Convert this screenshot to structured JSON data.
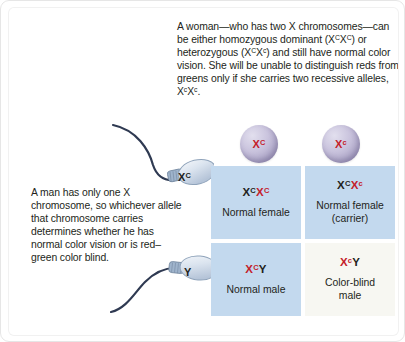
{
  "captions": {
    "female": "A woman—who has two X chromosomes—can be either homozygous dominant (X X ) or heterozygous (X X ) and still have normal color vision. She will be unable to distinguish reds from greens only if she carries two recessive alleles, X X .",
    "female_plain": "A woman—who has two X chromosomes—can be either homozygous dominant (XCXC) or heterozygous (XCXc) and still have normal color vision. She will be unable to distinguish reds from greens only if she carries two recessive alleles, XcXc.",
    "male": "A man has only one X chromosome, so whichever allele that chromosome carries determines whether he has normal color vision or is red–green color blind."
  },
  "gametes": {
    "eggs": [
      {
        "name": "egg-dominant",
        "allele_base": "X",
        "allele_sup": "C",
        "full": "XC"
      },
      {
        "name": "egg-recessive",
        "allele_base": "X",
        "allele_sup": "c",
        "full": "Xc"
      }
    ],
    "sperm": [
      {
        "name": "sperm-x",
        "allele_base": "X",
        "allele_sup": "C",
        "full": "XC"
      },
      {
        "name": "sperm-y",
        "allele_base": "Y",
        "allele_sup": "",
        "full": "Y"
      }
    ]
  },
  "punnett": {
    "cells": [
      {
        "position": "top-left",
        "first_base": "X",
        "first_sup": "C",
        "second_base": "X",
        "second_sup": "C",
        "genotype": "XCXC",
        "phenotype": "Normal female",
        "background": "#c3d9ee"
      },
      {
        "position": "top-right",
        "first_base": "X",
        "first_sup": "C",
        "second_base": "X",
        "second_sup": "c",
        "genotype": "XCXc",
        "phenotype": "Normal female\n(carrier)",
        "background": "#c3d9ee"
      },
      {
        "position": "bottom-left",
        "first_base": "X",
        "first_sup": "C",
        "second_base": "Y",
        "second_sup": "",
        "genotype": "XCY",
        "phenotype": "Normal male",
        "background": "#c3d9ee"
      },
      {
        "position": "bottom-right",
        "first_base": "X",
        "first_sup": "c",
        "second_base": "Y",
        "second_sup": "",
        "genotype": "XcY",
        "phenotype": "Color-blind\nmale",
        "background": "#f7f7f2"
      }
    ]
  },
  "colors": {
    "allele_red": "#c4202a",
    "allele_dark": "#231f20",
    "cell_blue": "#c3d9ee",
    "cell_pale": "#f7f7f2",
    "egg_purple": "#a9a1c4",
    "sperm_blue": "#cdd9e8"
  }
}
